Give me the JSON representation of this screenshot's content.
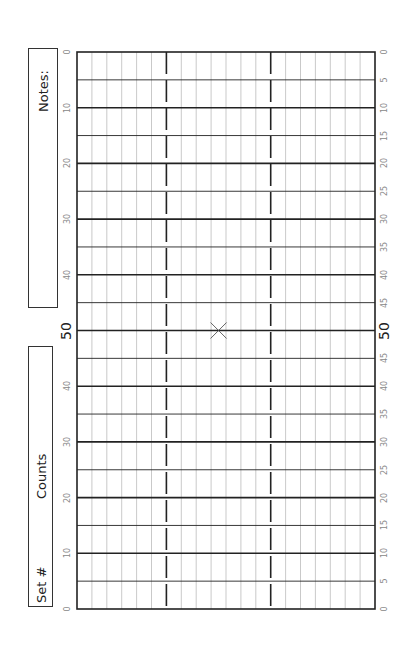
{
  "notes_box": {
    "label": "Notes:"
  },
  "counts_box": {
    "set_label": "Set #",
    "counts_label": "Counts"
  },
  "left_axis": {
    "ticks": [
      "0",
      "10",
      "20",
      "30",
      "40",
      "50",
      "40",
      "30",
      "20",
      "10",
      "0"
    ],
    "center_label": "50"
  },
  "right_axis": {
    "ticks": [
      "0",
      "5",
      "10",
      "15",
      "20",
      "25",
      "30",
      "35",
      "40",
      "45",
      "50",
      "45",
      "40",
      "35",
      "30",
      "25",
      "20",
      "15",
      "10",
      "5",
      "0"
    ],
    "center_label": "50"
  },
  "grid": {
    "columns": 20,
    "rows": 20,
    "dashed_columns": [
      6,
      13
    ],
    "center_marker": "X"
  },
  "colors": {
    "bold_line": "#222222",
    "thin_line": "#bbbbbb",
    "box_border": "#333333",
    "tick_text": "#888888"
  }
}
